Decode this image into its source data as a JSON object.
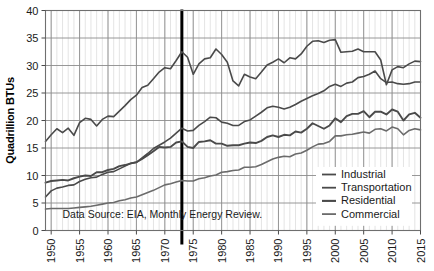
{
  "chart_data": {
    "type": "line",
    "title": "",
    "xlabel": "",
    "ylabel": "Quadrillion BTUs",
    "xlim": [
      1949,
      2015
    ],
    "ylim": [
      0,
      40
    ],
    "ytick_values": [
      0,
      5,
      10,
      15,
      20,
      25,
      30,
      35,
      40
    ],
    "ytick_labels": [
      "0",
      "5",
      "10",
      "15",
      "20",
      "25",
      "30",
      "35",
      "40"
    ],
    "xtick_values": [
      1950,
      1955,
      1960,
      1965,
      1970,
      1975,
      1980,
      1985,
      1990,
      1995,
      2000,
      2005,
      2010,
      2015
    ],
    "xtick_labels": [
      "1950",
      "1955",
      "1960",
      "1965",
      "1970",
      "1975",
      "1980",
      "1985",
      "1990",
      "1995",
      "2000",
      "2005",
      "2010",
      "2015"
    ],
    "grid": true,
    "grid_minor": true,
    "legend_position": "lower-right",
    "annotations": [
      {
        "name": "source-note",
        "text": "Data Source: EIA, Monthly Energy Review.",
        "x": 1952,
        "y": 2.2
      },
      {
        "name": "embargo-marker",
        "type": "vline",
        "x": 1973,
        "color": "#000000",
        "width": 3
      }
    ],
    "x": [
      1949,
      1950,
      1951,
      1952,
      1953,
      1954,
      1955,
      1956,
      1957,
      1958,
      1959,
      1960,
      1961,
      1962,
      1963,
      1964,
      1965,
      1966,
      1967,
      1968,
      1969,
      1970,
      1971,
      1972,
      1973,
      1974,
      1975,
      1976,
      1977,
      1978,
      1979,
      1980,
      1981,
      1982,
      1983,
      1984,
      1985,
      1986,
      1987,
      1988,
      1989,
      1990,
      1991,
      1992,
      1993,
      1994,
      1995,
      1996,
      1997,
      1998,
      1999,
      2000,
      2001,
      2002,
      2003,
      2004,
      2005,
      2006,
      2007,
      2008,
      2009,
      2010,
      2011,
      2012,
      2013,
      2014,
      2015
    ],
    "series": [
      {
        "name": "Industrial",
        "color": "#4a4a4a",
        "width": 1.6,
        "values": [
          16.2,
          17.4,
          18.5,
          17.8,
          18.6,
          17.3,
          19.6,
          20.4,
          20.2,
          19.0,
          20.2,
          20.8,
          20.7,
          21.7,
          22.7,
          23.8,
          24.6,
          26.0,
          26.4,
          27.6,
          28.8,
          29.6,
          29.4,
          30.9,
          32.5,
          31.5,
          28.4,
          30.3,
          31.2,
          31.4,
          33.0,
          32.0,
          30.6,
          27.2,
          26.3,
          28.4,
          27.9,
          27.6,
          28.8,
          30.1,
          30.6,
          31.2,
          30.5,
          31.4,
          31.2,
          32.1,
          33.5,
          34.4,
          34.5,
          34.2,
          34.6,
          34.7,
          32.4,
          32.5,
          32.6,
          33.0,
          32.5,
          32.5,
          32.5,
          31.0,
          26.5,
          29.2,
          29.8,
          29.6,
          30.3,
          30.8,
          30.7
        ]
      },
      {
        "name": "Transportation",
        "color": "#4a4a4a",
        "width": 1.6,
        "values": [
          6.1,
          7.2,
          7.7,
          7.9,
          8.2,
          8.3,
          8.9,
          9.3,
          9.6,
          9.7,
          10.2,
          10.6,
          10.7,
          11.2,
          11.7,
          12.2,
          12.4,
          13.2,
          14.0,
          14.9,
          15.5,
          16.1,
          16.8,
          17.7,
          18.6,
          18.1,
          18.2,
          19.1,
          19.8,
          20.6,
          20.5,
          19.7,
          19.5,
          19.1,
          19.1,
          19.8,
          20.1,
          20.8,
          21.5,
          22.3,
          22.6,
          22.4,
          22.1,
          22.4,
          22.9,
          23.5,
          24.0,
          24.5,
          24.9,
          25.4,
          26.2,
          26.6,
          26.2,
          26.8,
          27.0,
          27.8,
          28.0,
          28.4,
          29.0,
          27.6,
          26.9,
          27.0,
          26.7,
          26.6,
          26.7,
          27.0,
          27.0
        ]
      },
      {
        "name": "Residential",
        "color": "#4a4a4a",
        "width": 1.9,
        "values": [
          8.7,
          9.0,
          9.1,
          9.2,
          9.1,
          9.5,
          9.8,
          10.0,
          9.9,
          10.6,
          10.6,
          11.0,
          11.2,
          11.7,
          11.9,
          12.2,
          12.4,
          13.0,
          13.7,
          14.4,
          15.2,
          15.1,
          15.2,
          16.0,
          16.2,
          15.2,
          15.0,
          16.1,
          16.2,
          16.4,
          15.8,
          15.8,
          15.4,
          15.5,
          15.5,
          15.8,
          16.0,
          15.9,
          16.3,
          17.0,
          17.3,
          17.0,
          17.4,
          17.3,
          18.0,
          17.8,
          18.5,
          19.5,
          19.0,
          18.5,
          19.1,
          20.4,
          19.7,
          20.8,
          21.2,
          21.2,
          21.7,
          20.6,
          21.6,
          21.6,
          21.1,
          22.0,
          21.6,
          20.0,
          21.1,
          21.4,
          20.5
        ]
      },
      {
        "name": "Commercial",
        "color": "#6b6b6b",
        "width": 1.6,
        "values": [
          3.9,
          4.0,
          4.0,
          4.0,
          4.0,
          4.1,
          4.2,
          4.3,
          4.4,
          4.6,
          4.8,
          5.0,
          5.1,
          5.4,
          5.6,
          5.9,
          6.1,
          6.5,
          6.9,
          7.3,
          7.8,
          8.3,
          8.5,
          8.8,
          9.1,
          9.0,
          9.0,
          9.4,
          9.6,
          9.9,
          10.1,
          10.6,
          10.7,
          10.9,
          11.0,
          11.5,
          11.5,
          11.6,
          12.0,
          12.5,
          13.0,
          13.3,
          13.5,
          13.4,
          13.9,
          14.1,
          14.6,
          15.2,
          15.7,
          15.8,
          16.2,
          17.2,
          17.2,
          17.4,
          17.5,
          17.7,
          17.9,
          17.7,
          18.4,
          18.5,
          18.1,
          18.8,
          18.5,
          17.4,
          18.2,
          18.5,
          18.3
        ]
      }
    ]
  },
  "legend": {
    "items": [
      {
        "label": "Industrial"
      },
      {
        "label": "Transportation"
      },
      {
        "label": "Residential"
      },
      {
        "label": "Commercial"
      }
    ]
  },
  "axis": {
    "y_title": "Quadrillion BTUs"
  },
  "source": {
    "text": "Data Source: EIA, Monthly Energy Review."
  }
}
